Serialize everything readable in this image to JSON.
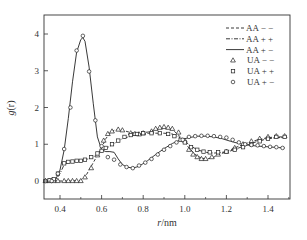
{
  "chart_data": {
    "type": "line",
    "title": "",
    "xlabel": "r/nm",
    "ylabel": "g(r)",
    "xlim": [
      0.32,
      1.5
    ],
    "ylim": [
      -0.5,
      4.4
    ],
    "x_ticks": [
      0.4,
      0.6,
      0.8,
      1.0,
      1.2,
      1.4
    ],
    "x_tick_labels": [
      "0.4",
      "0.6",
      "0.8",
      "1.0",
      "1.2",
      "1.4"
    ],
    "y_ticks": [
      0,
      1,
      2,
      3,
      4
    ],
    "y_tick_labels": [
      "0",
      "1",
      "2",
      "3",
      "4"
    ],
    "grid": false,
    "legend_position": "upper right",
    "series": [
      {
        "name": "AA − −",
        "style": "dashed-line",
        "x": [
          0.32,
          0.4,
          0.45,
          0.5,
          0.52,
          0.54,
          0.56,
          0.58,
          0.6,
          0.62,
          0.64,
          0.66,
          0.68,
          0.7,
          0.74,
          0.78,
          0.82,
          0.86,
          0.9,
          0.94,
          0.97,
          1.0,
          1.02,
          1.05,
          1.08,
          1.11,
          1.14,
          1.18,
          1.22,
          1.26,
          1.3,
          1.35,
          1.4,
          1.45,
          1.48
        ],
        "y": [
          0,
          0,
          0,
          0.02,
          0.1,
          0.3,
          0.5,
          0.7,
          0.9,
          1.15,
          1.3,
          1.38,
          1.4,
          1.38,
          1.32,
          1.3,
          1.33,
          1.4,
          1.45,
          1.4,
          1.25,
          1.05,
          0.9,
          0.72,
          0.62,
          0.6,
          0.65,
          0.75,
          0.85,
          0.95,
          1.03,
          1.12,
          1.18,
          1.2,
          1.2
        ]
      },
      {
        "name": "AA + +",
        "style": "dash-dot-line",
        "x": [
          0.32,
          0.38,
          0.4,
          0.42,
          0.45,
          0.48,
          0.52,
          0.55,
          0.58,
          0.6,
          0.62,
          0.64,
          0.66,
          0.7,
          0.74,
          0.78,
          0.82,
          0.86,
          0.9,
          0.94,
          0.97,
          1.0,
          1.03,
          1.06,
          1.1,
          1.14,
          1.18,
          1.22,
          1.26,
          1.3,
          1.35,
          1.4,
          1.45,
          1.48
        ],
        "y": [
          0,
          0.02,
          0.2,
          0.45,
          0.52,
          0.55,
          0.58,
          0.62,
          0.72,
          0.8,
          0.88,
          0.95,
          1.02,
          1.15,
          1.22,
          1.28,
          1.3,
          1.3,
          1.3,
          1.28,
          1.2,
          1.08,
          0.95,
          0.85,
          0.78,
          0.76,
          0.78,
          0.82,
          0.9,
          0.98,
          1.08,
          1.15,
          1.18,
          1.18
        ]
      },
      {
        "name": "AA + −",
        "style": "solid-line",
        "x": [
          0.32,
          0.36,
          0.38,
          0.4,
          0.42,
          0.44,
          0.46,
          0.48,
          0.5,
          0.51,
          0.52,
          0.54,
          0.56,
          0.58,
          0.6,
          0.62,
          0.64,
          0.66,
          0.68,
          0.7,
          0.72,
          0.75,
          0.78,
          0.82,
          0.86,
          0.9,
          0.94,
          0.98,
          1.02,
          1.06,
          1.1,
          1.14,
          1.18,
          1.22,
          1.26,
          1.3,
          1.35,
          1.4,
          1.45,
          1.48
        ],
        "y": [
          0,
          0,
          0.05,
          0.3,
          0.85,
          1.7,
          2.7,
          3.5,
          3.85,
          3.9,
          3.8,
          3.1,
          2.1,
          1.2,
          0.85,
          0.8,
          0.8,
          0.78,
          0.6,
          0.45,
          0.38,
          0.35,
          0.4,
          0.55,
          0.72,
          0.88,
          1.02,
          1.12,
          1.18,
          1.22,
          1.22,
          1.2,
          1.15,
          1.08,
          1.02,
          0.98,
          0.95,
          0.93,
          0.91,
          0.9
        ]
      },
      {
        "name": "UA − −",
        "style": "triangle-markers",
        "x": [
          0.33,
          0.35,
          0.37,
          0.39,
          0.42,
          0.44,
          0.46,
          0.48,
          0.5,
          0.52,
          0.55,
          0.58,
          0.61,
          0.63,
          0.65,
          0.68,
          0.7,
          0.74,
          0.76,
          0.78,
          0.8,
          0.84,
          0.86,
          0.88,
          0.9,
          0.92,
          0.94,
          0.97,
          1.0,
          1.02,
          1.04,
          1.06,
          1.08,
          1.1,
          1.13,
          1.16,
          1.2,
          1.24,
          1.28,
          1.32,
          1.36,
          1.4,
          1.44,
          1.48
        ],
        "y": [
          0,
          0,
          0,
          0,
          0,
          0,
          0,
          0,
          0,
          0.1,
          0.35,
          0.7,
          1.1,
          1.28,
          1.35,
          1.4,
          1.38,
          1.3,
          1.28,
          1.27,
          1.3,
          1.35,
          1.42,
          1.45,
          1.47,
          1.45,
          1.42,
          1.32,
          1.1,
          0.85,
          0.72,
          0.65,
          0.6,
          0.6,
          0.65,
          0.72,
          0.8,
          0.9,
          1.0,
          1.08,
          1.15,
          1.2,
          1.22,
          1.22
        ]
      },
      {
        "name": "UA + +",
        "style": "square-markers",
        "x": [
          0.33,
          0.35,
          0.37,
          0.39,
          0.42,
          0.44,
          0.46,
          0.48,
          0.5,
          0.52,
          0.55,
          0.58,
          0.6,
          0.62,
          0.65,
          0.68,
          0.71,
          0.74,
          0.77,
          0.8,
          0.84,
          0.88,
          0.92,
          0.95,
          0.98,
          1.0,
          1.03,
          1.06,
          1.09,
          1.12,
          1.16,
          1.2,
          1.24,
          1.28,
          1.32,
          1.36,
          1.4,
          1.44,
          1.48
        ],
        "y": [
          0,
          0.02,
          0.05,
          0.2,
          0.48,
          0.52,
          0.53,
          0.55,
          0.55,
          0.58,
          0.65,
          0.75,
          0.82,
          0.9,
          1.0,
          1.1,
          1.2,
          1.25,
          1.28,
          1.3,
          1.3,
          1.3,
          1.28,
          1.22,
          1.12,
          1.05,
          0.92,
          0.85,
          0.8,
          0.78,
          0.78,
          0.8,
          0.85,
          0.92,
          1.0,
          1.08,
          1.15,
          1.2,
          1.2
        ]
      },
      {
        "name": "UA + −",
        "style": "circle-markers",
        "x": [
          0.33,
          0.36,
          0.39,
          0.42,
          0.45,
          0.48,
          0.51,
          0.54,
          0.57,
          0.6,
          0.63,
          0.66,
          0.69,
          0.72,
          0.75,
          0.78,
          0.81,
          0.84,
          0.87,
          0.9,
          0.93,
          0.96,
          0.99,
          1.02,
          1.05,
          1.08,
          1.11,
          1.14,
          1.17,
          1.2,
          1.23,
          1.26,
          1.29,
          1.32,
          1.35,
          1.38,
          1.41,
          1.44,
          1.47
        ],
        "y": [
          0,
          0,
          0.2,
          0.87,
          2.0,
          3.55,
          3.95,
          2.98,
          1.65,
          0.95,
          0.65,
          0.58,
          0.45,
          0.38,
          0.35,
          0.42,
          0.5,
          0.6,
          0.72,
          0.85,
          0.95,
          1.05,
          1.12,
          1.2,
          1.22,
          1.23,
          1.23,
          1.22,
          1.2,
          1.18,
          1.12,
          1.05,
          1.0,
          0.98,
          0.97,
          0.95,
          0.93,
          0.92,
          0.9
        ]
      }
    ]
  },
  "axes": {
    "xlabel_italic": "r",
    "xlabel_unit": "/nm",
    "ylabel_italic": "g",
    "ylabel_paren": "(r)"
  },
  "legend": {
    "items": [
      {
        "label": "AA − −",
        "symbol": "dashed-line"
      },
      {
        "label": "AA + +",
        "symbol": "dash-dot-line"
      },
      {
        "label": "AA + −",
        "symbol": "solid-line"
      },
      {
        "label": "UA − −",
        "symbol": "triangle-icon"
      },
      {
        "label": "UA + +",
        "symbol": "square-icon"
      },
      {
        "label": "UA + −",
        "symbol": "circle-icon"
      }
    ]
  },
  "colors": {
    "axis": "#333333",
    "series": "#222222",
    "background": "#ffffff"
  }
}
